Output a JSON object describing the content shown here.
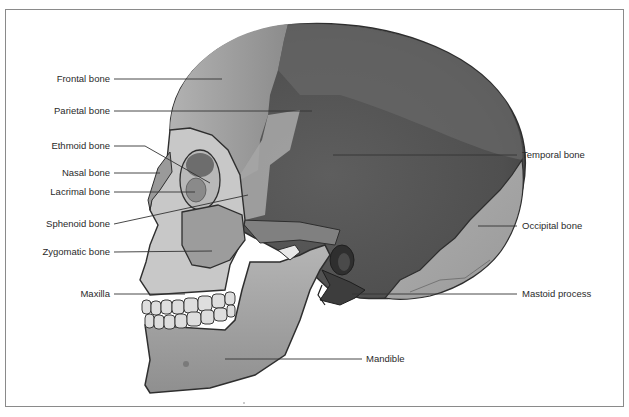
{
  "diagram": {
    "frame_color": "#8a8a8a",
    "colors": {
      "frontal": "#9a9a9a",
      "parietal": "#6e6e6e",
      "temporal": "#565656",
      "occipital": "#a6a6a6",
      "face_light": "#c9c9c9",
      "mandible": "#a3a3a3",
      "outline": "#2e2e2e",
      "leader_line": "#333333",
      "label_text": "#2a2a2a"
    },
    "labels": {
      "frontal": "Frontal bone",
      "parietal": "Parietal bone",
      "ethmoid": "Ethmoid bone",
      "nasal": "Nasal bone",
      "lacrimal": "Lacrimal bone",
      "sphenoid": "Sphenoid bone",
      "zygomatic": "Zygomatic bone",
      "maxilla": "Maxilla",
      "temporal": "Temporal bone",
      "occipital": "Occipital bone",
      "mastoid": "Mastoid process",
      "mandible": "Mandible"
    }
  }
}
